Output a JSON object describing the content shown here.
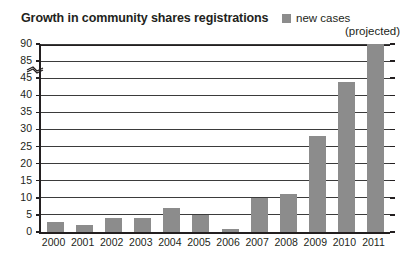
{
  "chart_data": {
    "type": "bar",
    "title": "Growth in community shares registrations",
    "xlabel": "",
    "ylabel": "",
    "categories": [
      "2000",
      "2001",
      "2002",
      "2003",
      "2004",
      "2005",
      "2006",
      "2007",
      "2008",
      "2009",
      "2010",
      "2011"
    ],
    "series": [
      {
        "name": "new cases",
        "values": [
          3,
          2,
          4,
          4,
          7,
          5,
          1,
          10,
          11,
          28,
          44,
          90
        ]
      }
    ],
    "values": [
      3,
      2,
      4,
      4,
      7,
      5,
      1,
      10,
      11,
      28,
      44,
      90
    ],
    "ytick_labels": [
      "0",
      "5",
      "10",
      "15",
      "20",
      "25",
      "30",
      "35",
      "40",
      "45",
      "85",
      "90"
    ],
    "ylim": [
      0,
      90
    ],
    "axis_break": {
      "between": [
        "45",
        "85"
      ],
      "present": true
    },
    "grid": true,
    "legend_position": "top-right",
    "legend": [
      {
        "label": "new cases",
        "color": "#8c8c8c"
      }
    ],
    "annotations": [
      "(projected)"
    ],
    "bar_color": "#8c8c8c",
    "axis_color": "#231f20"
  },
  "legend": {
    "series_label": "new cases",
    "projected_note": "(projected)"
  }
}
